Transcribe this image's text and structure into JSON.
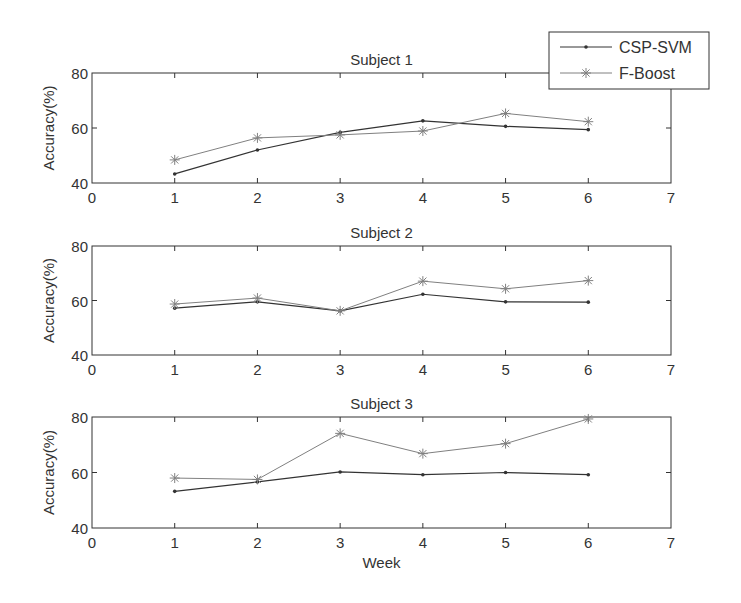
{
  "chart_data": [
    {
      "type": "line",
      "title": "Subject 1",
      "xlabel": "",
      "ylabel": "Accuracy(%)",
      "xlim": [
        0,
        7
      ],
      "ylim": [
        40,
        80
      ],
      "xticks": [
        "0",
        "1",
        "2",
        "3",
        "4",
        "5",
        "6",
        "7"
      ],
      "yticks": [
        "40",
        "60",
        "80"
      ],
      "x": [
        1,
        2,
        3,
        4,
        5,
        6
      ],
      "series": [
        {
          "name": "CSP-SVM",
          "values": [
            43.3,
            52.0,
            58.4,
            62.6,
            60.6,
            59.4
          ]
        },
        {
          "name": "F-Boost",
          "values": [
            48.4,
            56.4,
            57.5,
            58.9,
            65.3,
            62.3
          ]
        }
      ]
    },
    {
      "type": "line",
      "title": "Subject 2",
      "xlabel": "",
      "ylabel": "Accuracy(%)",
      "xlim": [
        0,
        7
      ],
      "ylim": [
        40,
        80
      ],
      "xticks": [
        "0",
        "1",
        "2",
        "3",
        "4",
        "5",
        "6",
        "7"
      ],
      "yticks": [
        "40",
        "60",
        "80"
      ],
      "x": [
        1,
        2,
        3,
        4,
        5,
        6
      ],
      "series": [
        {
          "name": "CSP-SVM",
          "values": [
            57.2,
            59.5,
            56.2,
            62.3,
            59.5,
            59.4
          ]
        },
        {
          "name": "F-Boost",
          "values": [
            58.7,
            60.9,
            56.2,
            67.1,
            64.3,
            67.3
          ]
        }
      ]
    },
    {
      "type": "line",
      "title": "Subject 3",
      "xlabel": "Week",
      "ylabel": "Accuracy(%)",
      "xlim": [
        0,
        7
      ],
      "ylim": [
        40,
        80
      ],
      "xticks": [
        "0",
        "1",
        "2",
        "3",
        "4",
        "5",
        "6",
        "7"
      ],
      "yticks": [
        "40",
        "60",
        "80"
      ],
      "x": [
        1,
        2,
        3,
        4,
        5,
        6
      ],
      "series": [
        {
          "name": "CSP-SVM",
          "values": [
            53.2,
            56.6,
            60.2,
            59.2,
            60.0,
            59.2
          ]
        },
        {
          "name": "F-Boost",
          "values": [
            58.0,
            57.5,
            74.1,
            66.8,
            70.4,
            79.3
          ]
        }
      ]
    }
  ],
  "legend": {
    "placement": "top-right",
    "entries": [
      {
        "name": "CSP-SVM",
        "marker": "dot",
        "color": "#333333"
      },
      {
        "name": "F-Boost",
        "marker": "asterisk",
        "color": "#808080"
      }
    ]
  },
  "colors": {
    "axes": "#333333",
    "csp_svm": "#333333",
    "f_boost": "#808080"
  }
}
